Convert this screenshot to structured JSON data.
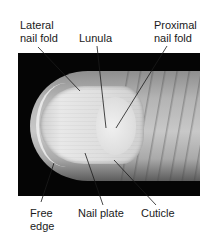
{
  "figure": {
    "labels": {
      "lateral_nail_fold": "Lateral\nnail fold",
      "lunula": "Lunula",
      "proximal_nail_fold": "Proximal\nnail fold",
      "free_edge": "Free\nedge",
      "nail_plate": "Nail plate",
      "cuticle": "Cuticle"
    },
    "colors": {
      "background": "#ffffff",
      "photo_background": "#050505",
      "leader_line": "#1a1a1a",
      "text": "#1a1a1a"
    }
  }
}
